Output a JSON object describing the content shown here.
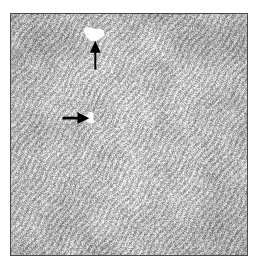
{
  "figure": {
    "domain": "micrograph",
    "caption": "",
    "canvas": {
      "width": 258,
      "height": 266,
      "background": "#ffffff"
    }
  },
  "micrograph": {
    "name": "microstructure-micrograph",
    "frame": {
      "x": 10,
      "y": 13,
      "width": 238,
      "height": 243
    },
    "border_color": "#4a4a4a",
    "border_width": 1,
    "description": "Grayscale speckled lamellar microstructure with fine acicular contrast",
    "texture": {
      "base_gray": "#b9b9b9",
      "light_gray": "#efefef",
      "dark_gray": "#4c4c4c",
      "mean_level": 185,
      "contrast_spread": 95,
      "grain_scale_px": 2,
      "streak_angle_deg": 35,
      "seed": 20477
    },
    "features": [
      {
        "name": "void-upper",
        "type": "white-void",
        "cx": 84,
        "cy": 20,
        "rx": 9,
        "ry": 8,
        "color": "#ffffff"
      },
      {
        "name": "void-middle",
        "type": "white-void",
        "cx": 80,
        "cy": 105,
        "rx": 5,
        "ry": 5,
        "color": "#ffffff"
      }
    ],
    "annotations": [
      {
        "name": "arrow-up-to-upper-void",
        "type": "arrow",
        "direction": "up",
        "color": "#000000",
        "tail_x": 85,
        "tail_y": 56,
        "tip_x": 85,
        "tip_y": 27,
        "shaft_width": 2,
        "head_width": 11,
        "head_length": 12
      },
      {
        "name": "arrow-right-to-middle-void",
        "type": "arrow",
        "direction": "right",
        "color": "#000000",
        "tail_x": 52,
        "tail_y": 105,
        "tip_x": 79,
        "tip_y": 105,
        "shaft_width": 3,
        "head_width": 12,
        "head_length": 12
      }
    ]
  }
}
